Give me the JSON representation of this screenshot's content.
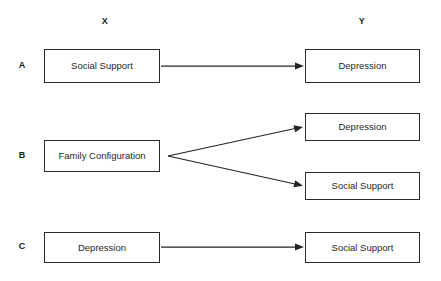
{
  "figure": {
    "background_color": "#ffffff",
    "line_color": "#242424",
    "text_color": "#1f1f1f"
  },
  "headers": {
    "predictor": "X",
    "outcome": "Y"
  },
  "rows": [
    {
      "letter": "A",
      "source": "Social Support",
      "targets": [
        "Depression"
      ]
    },
    {
      "letter": "B",
      "source": "Family Configuration",
      "targets": [
        "Depression",
        "Social Support"
      ]
    },
    {
      "letter": "C",
      "source": "Depression",
      "targets": [
        "Social Support"
      ]
    }
  ],
  "arrows": [
    {
      "name": "arrow-a",
      "from": "Social Support",
      "to": "Depression"
    },
    {
      "name": "arrow-b-upper",
      "from": "Family Configuration",
      "to": "Depression"
    },
    {
      "name": "arrow-b-lower",
      "from": "Family Configuration",
      "to": "Social Support"
    },
    {
      "name": "arrow-c",
      "from": "Depression",
      "to": "Social Support"
    }
  ]
}
